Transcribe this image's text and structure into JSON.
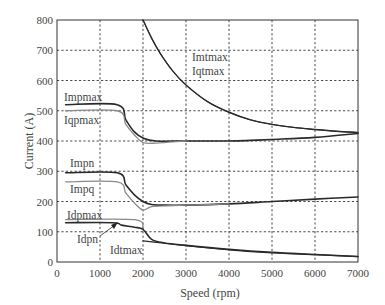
{
  "chart_data": {
    "type": "line",
    "title": "",
    "xlabel": "Speed (rpm)",
    "ylabel": "Current (A)",
    "xlim": [
      0,
      7000
    ],
    "ylim": [
      0,
      800
    ],
    "xticks": [
      0,
      1000,
      2000,
      3000,
      4000,
      5000,
      6000,
      7000
    ],
    "yticks": [
      0,
      100,
      200,
      300,
      400,
      500,
      600,
      700,
      800
    ],
    "grid": true,
    "legend": "inline labels",
    "series": [
      {
        "name": "Impmax",
        "color": "#2a2a2a",
        "width": 1.6,
        "x": [
          200,
          1400,
          1600,
          1800,
          2000,
          2300,
          3000,
          4000,
          4500,
          5000,
          6000,
          7000
        ],
        "y": [
          520,
          520,
          470,
          430,
          410,
          400,
          400,
          400,
          402,
          405,
          412,
          425
        ]
      },
      {
        "name": "Iqpmax",
        "color": "#8a8a8a",
        "width": 1.3,
        "x": [
          200,
          1400,
          1600,
          1800,
          2000,
          2300,
          2600,
          3000
        ],
        "y": [
          500,
          500,
          455,
          420,
          395,
          393,
          396,
          400
        ]
      },
      {
        "name": "Imtmax",
        "color": "#2a2a2a",
        "width": 1.4,
        "x": [
          2000,
          2200,
          2400,
          2700,
          3000,
          3500,
          4000,
          4500,
          5000,
          5500,
          6000,
          6500,
          7000
        ],
        "y": [
          800,
          740,
          690,
          630,
          585,
          530,
          495,
          470,
          455,
          445,
          438,
          432,
          428
        ]
      },
      {
        "name": "Iqtmax",
        "color": "#2a2a2a",
        "width": 1.0,
        "x": [
          2000,
          2200,
          2400,
          2700,
          3000,
          3500,
          4000,
          4500,
          5000,
          5500,
          6000,
          6500,
          7000
        ],
        "y": [
          800,
          740,
          690,
          630,
          585,
          530,
          495,
          470,
          455,
          445,
          438,
          432,
          428
        ]
      },
      {
        "name": "Impn",
        "color": "#2a2a2a",
        "width": 1.6,
        "x": [
          200,
          1400,
          1600,
          1800,
          2000,
          2200,
          2500,
          3000,
          4000,
          5000,
          6000,
          7000
        ],
        "y": [
          295,
          295,
          255,
          222,
          200,
          190,
          188,
          188,
          192,
          200,
          208,
          215
        ]
      },
      {
        "name": "Impq",
        "color": "#8a8a8a",
        "width": 1.3,
        "x": [
          200,
          1400,
          1600,
          1800,
          2000,
          2200,
          2600,
          3000,
          4000
        ],
        "y": [
          265,
          265,
          228,
          195,
          172,
          183,
          186,
          188,
          192
        ]
      },
      {
        "name": "Idpmax",
        "color": "#8a8a8a",
        "width": 1.3,
        "x": [
          200,
          1800,
          2000
        ],
        "y": [
          140,
          140,
          110
        ]
      },
      {
        "name": "Idpn",
        "color": "#2a2a2a",
        "width": 1.6,
        "x": [
          200,
          1300,
          1500,
          1800,
          2000,
          2200,
          2500,
          3000,
          4000,
          5000,
          6000,
          7000
        ],
        "y": [
          130,
          130,
          122,
          115,
          108,
          75,
          63,
          55,
          42,
          32,
          25,
          18
        ]
      },
      {
        "name": "Idtmax",
        "color": "#2a2a2a",
        "width": 1.2,
        "x": [
          2000,
          2500,
          3000,
          4000,
          5000,
          6000,
          7000
        ],
        "y": [
          70,
          62,
          54,
          40,
          30,
          24,
          18
        ]
      }
    ],
    "annotations": [
      {
        "text": "Impmax",
        "x": 200,
        "y": 540
      },
      {
        "text": "Iqpmax",
        "x": 200,
        "y": 480
      },
      {
        "text": "Imtmax",
        "x": 3200,
        "y": 690
      },
      {
        "text": "Iqtmax",
        "x": 3200,
        "y": 645
      },
      {
        "text": "Impn",
        "x": 200,
        "y": 320
      },
      {
        "text": "Impq",
        "x": 200,
        "y": 240
      },
      {
        "text": "Idpmax",
        "x": 200,
        "y": 160
      },
      {
        "text": "Idpn",
        "x": 500,
        "y": 80
      },
      {
        "text": "Idtmax",
        "x": 1250,
        "y": 35
      }
    ]
  },
  "labels": {
    "xlabel": "Speed (rpm)",
    "ylabel": "Current (A)",
    "Impmax": "Impmax",
    "Iqpmax": "Iqpmax",
    "Imtmax": "Imtmax",
    "Iqtmax": "Iqtmax",
    "Impn": "Impn",
    "Impq": "Impq",
    "Idpmax": "Idpmax",
    "Idpn": "Idpn",
    "Idtmax": "Idtmax"
  }
}
